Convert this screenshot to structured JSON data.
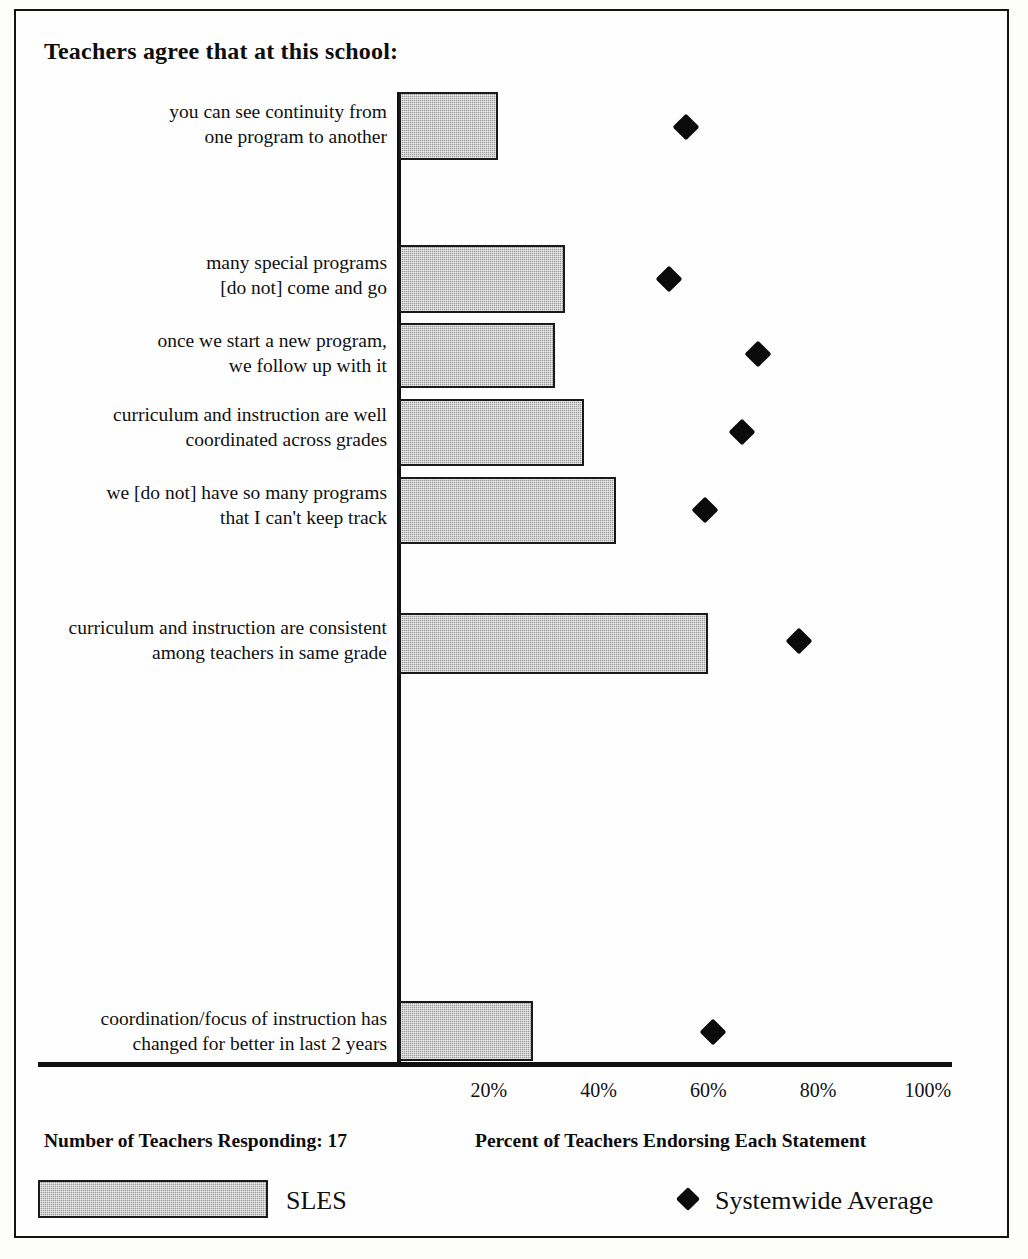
{
  "chart_data": {
    "type": "bar",
    "orientation": "horizontal",
    "title": "Teachers agree that at this school:",
    "xlabel": "Percent of Teachers Endorsing Each Statement",
    "ylabel": "",
    "xlim": [
      0,
      100
    ],
    "xticks": [
      "20%",
      "40%",
      "60%",
      "80%",
      "100%"
    ],
    "xtick_values": [
      20,
      40,
      60,
      80,
      100
    ],
    "grid": false,
    "legend_position": "bottom",
    "categories": [
      "you can see continuity from\none program to another",
      "many special programs\n[do not] come and go",
      "once we start a new program,\nwe follow up with it",
      "curriculum and instruction are well\ncoordinated across grades",
      "we [do not] have so many programs\nthat I can't keep track",
      "curriculum and instruction are consistent\namong teachers in same grade",
      "coordination/focus of instruction has\nchanged for better in last 2 years"
    ],
    "series": [
      {
        "name": "SLES",
        "marker": "bar",
        "color": "#9d9d9d",
        "values": [
          21.7,
          33.9,
          32.1,
          37.3,
          43.2,
          60.0,
          28.0
        ]
      },
      {
        "name": "Systemwide Average",
        "marker": "diamond",
        "color": "#0b0b0b",
        "values": [
          55.9,
          52.8,
          69.0,
          66.1,
          59.4,
          76.5,
          60.9
        ]
      }
    ]
  },
  "footer": {
    "respondents": "Number of Teachers Responding: 17",
    "axis_caption": "Percent of Teachers Endorsing Each Statement"
  },
  "legend": {
    "bar_label": "SLES",
    "marker_label": "Systemwide Average"
  }
}
